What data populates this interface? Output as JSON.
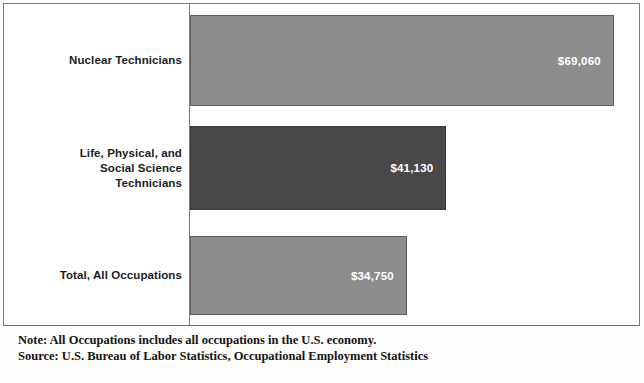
{
  "chart_data": {
    "type": "bar",
    "orientation": "horizontal",
    "title": "",
    "subtitle": "",
    "xlabel": "",
    "ylabel": "",
    "grid": false,
    "legend": null,
    "axis_range": [
      0,
      80000
    ],
    "value_prefix": "$",
    "categories": [
      "Nuclear Technicians",
      "Life, Physical, and Social Science Technicians",
      "Total, All Occupations"
    ],
    "values": [
      69060,
      41130,
      34750
    ],
    "value_labels": [
      "$69,060",
      "$41,130",
      "$34,750"
    ],
    "bar_colors": [
      "#8d8d8d",
      "#494949",
      "#8d8d8d"
    ],
    "bars": [
      {
        "label_lines": [
          "Nuclear Technicians"
        ],
        "value": 69060,
        "value_label": "$69,060",
        "color": "#8d8d8d",
        "style": "light",
        "width_pct": 94.4
      },
      {
        "label_lines": [
          "Life, Physical, and",
          "Social Science",
          "Technicians"
        ],
        "value": 41130,
        "value_label": "$41,130",
        "color": "#494949",
        "style": "dark",
        "width_pct": 57.1
      },
      {
        "label_lines": [
          "Total, All Occupations"
        ],
        "value": 34750,
        "value_label": "$34,750",
        "color": "#8d8d8d",
        "style": "light",
        "width_pct": 48.3
      }
    ],
    "annotations": [
      "Note: All Occupations includes all occupations in the U.S. economy.",
      "Source: U.S. Bureau of Labor Statistics, Occupational Employment Statistics"
    ]
  },
  "footnotes": {
    "note": "Note: All Occupations includes all occupations in the U.S. economy.",
    "source": "Source: U.S. Bureau of Labor Statistics, Occupational Employment Statistics"
  },
  "colors": {
    "bar_light": "#8d8d8d",
    "bar_dark": "#494949",
    "frame": "#7b7b7b",
    "value_text": "#ffffff",
    "label_text": "#1c1c1c"
  }
}
